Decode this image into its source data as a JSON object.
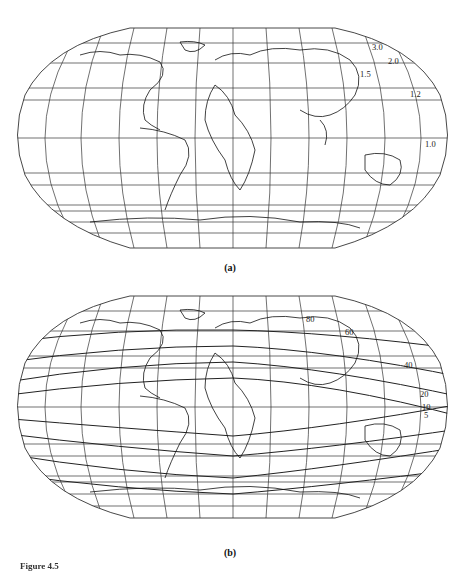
{
  "figure": {
    "caption": "Figure 4.5",
    "panels": [
      {
        "label": "(a)",
        "projection": "Robinson world map with graticule",
        "contour_labels": [
          "3.0",
          "2.0",
          "1.5",
          "1.2",
          "1.0"
        ]
      },
      {
        "label": "(b)",
        "projection": "Robinson world map with graticule",
        "contour_labels": [
          "80",
          "60",
          "40",
          "20",
          "10",
          "5"
        ]
      }
    ]
  },
  "colors": {
    "background": "#ffffff",
    "lines": "#222222"
  }
}
